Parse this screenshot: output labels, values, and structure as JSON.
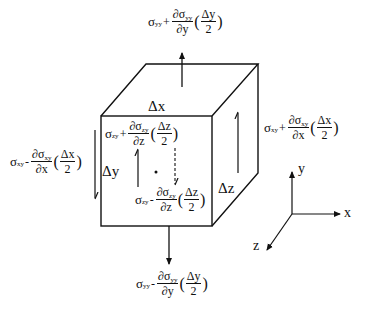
{
  "diagram": {
    "colors": {
      "stroke": "#111111",
      "background": "#ffffff"
    },
    "dimensions": {
      "dx": "Δx",
      "dy": "Δy",
      "dz": "Δz"
    },
    "axes": {
      "x": "x",
      "y": "y",
      "z": "z"
    },
    "labels": {
      "top": {
        "sigma": "σ",
        "sub": "yy",
        "op": "+",
        "d_num": "∂σ",
        "d_num_sub": "yy",
        "d_den": "∂y",
        "half_num": "Δy",
        "half_den": "2"
      },
      "bottom": {
        "sigma": "σ",
        "sub": "yy",
        "op": "-",
        "d_num": "∂σ",
        "d_num_sub": "yy",
        "d_den": "∂y",
        "half_num": "Δy",
        "half_den": "2"
      },
      "left": {
        "sigma": "σ",
        "sub": "xy",
        "op": "-",
        "d_num": "∂σ",
        "d_num_sub": "xy",
        "d_den": "∂x",
        "half_num": "Δx",
        "half_den": "2"
      },
      "right": {
        "sigma": "σ",
        "sub": "xy",
        "op": "+",
        "d_num": "∂σ",
        "d_num_sub": "xy",
        "d_den": "∂x",
        "half_num": "Δx",
        "half_den": "2"
      },
      "front": {
        "sigma": "σ",
        "sub": "zy",
        "op": "+",
        "d_num": "∂σ",
        "d_num_sub": "zy",
        "d_den": "∂z",
        "half_num": "Δz",
        "half_den": "2"
      },
      "back": {
        "sigma": "σ",
        "sub": "zy",
        "op": "-",
        "d_num": "∂σ",
        "d_num_sub": "zy",
        "d_den": "∂z",
        "half_num": "Δz",
        "half_den": "2"
      }
    }
  }
}
